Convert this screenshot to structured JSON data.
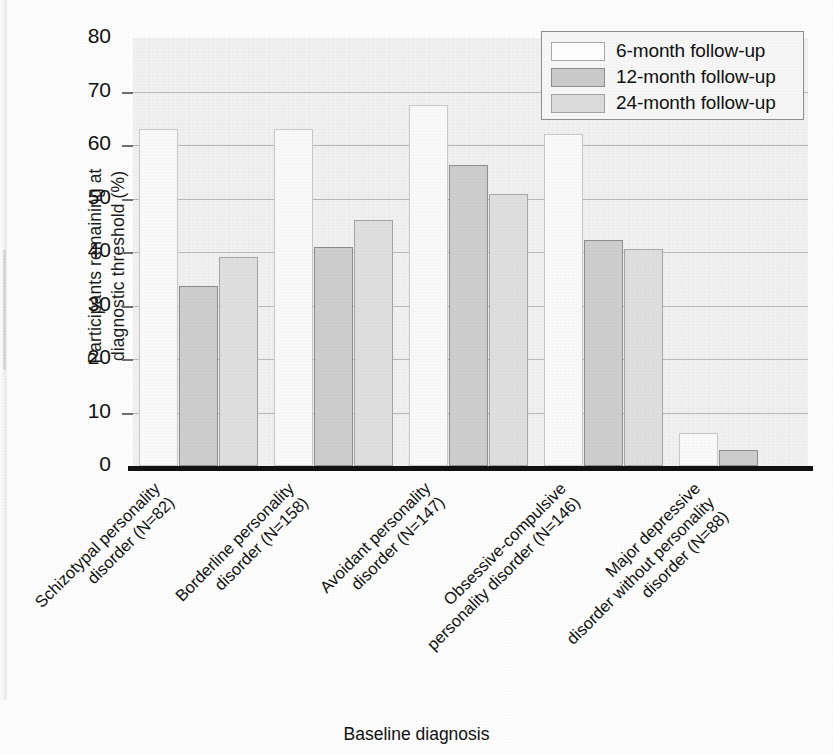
{
  "chart_data": {
    "type": "bar",
    "title": "",
    "xlabel": "Baseline diagnosis",
    "ylabel": "Participants remaining at diagnostic threshold (%)",
    "ylim": [
      0,
      80
    ],
    "yticks": [
      0,
      10,
      20,
      30,
      40,
      50,
      60,
      70,
      80
    ],
    "grid": true,
    "legend_position": "top-right",
    "categories": [
      "Schizotypal personality disorder (N=82)",
      "Borderline personality disorder (N=158)",
      "Avoidant personality disorder (N=147)",
      "Obsessive-compulsive personality disorder (N=146)",
      "Major depressive disorder without personality disorder (N=88)"
    ],
    "category_lines": [
      [
        "Schizotypal personality",
        "disorder (N=82)"
      ],
      [
        "Borderline personality",
        "disorder (N=158)"
      ],
      [
        "Avoidant personality",
        "disorder (N=147)"
      ],
      [
        "Obsessive-compulsive",
        "personality disorder (N=146)"
      ],
      [
        "Major depressive",
        "disorder without personality",
        "disorder (N=88)"
      ]
    ],
    "series": [
      {
        "name": "6-month follow-up",
        "color": "#fbfbfb",
        "values": [
          63,
          63,
          67.5,
          62,
          6.2
        ]
      },
      {
        "name": "12-month follow-up",
        "color": "#cfcfcf",
        "values": [
          33.7,
          41,
          56.2,
          42.2,
          3
        ]
      },
      {
        "name": "24-month follow-up",
        "color": "#e0e0e0",
        "values": [
          39,
          46,
          50.8,
          40.5,
          null
        ]
      }
    ]
  },
  "legend": {
    "items": [
      {
        "label": "6-month follow-up"
      },
      {
        "label": "12-month follow-up"
      },
      {
        "label": "24-month follow-up"
      }
    ]
  },
  "axes": {
    "y_title_line1": "Participants remaining at",
    "y_title_line2": "diagnostic threshold (%)",
    "x_title": "Baseline diagnosis"
  }
}
